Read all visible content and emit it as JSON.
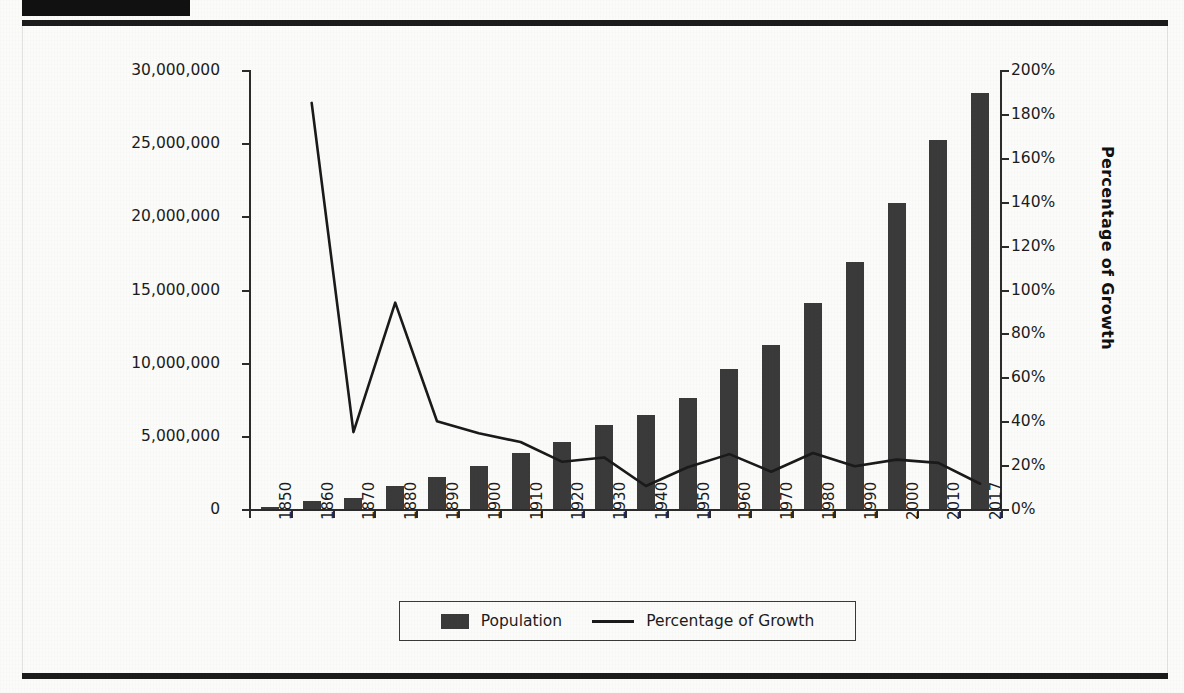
{
  "header": {
    "block_label": "",
    "title": "",
    "rule_color": "#1b1b1b"
  },
  "colors": {
    "bar": "#3a3a3a",
    "line": "#1a1a1a",
    "axis": "#2b2b2b",
    "text": "#1c1c1c",
    "background": "#fbfbfa"
  },
  "axis_left": {
    "title": "Population",
    "ticks": [
      "0",
      "5,000,000",
      "10,000,000",
      "15,000,000",
      "20,000,000",
      "25,000,000",
      "30,000,000"
    ]
  },
  "axis_right": {
    "title": "Percentage of Growth",
    "ticks": [
      "0%",
      "20%",
      "40%",
      "60%",
      "80%",
      "100%",
      "120%",
      "140%",
      "160%",
      "180%",
      "200%"
    ]
  },
  "legend": {
    "position": "bottom",
    "items": [
      {
        "label": "Population",
        "marker": "bar-swatch"
      },
      {
        "label": "Percentage of Growth",
        "marker": "line-swatch"
      }
    ]
  },
  "chart_data": {
    "type": "bar",
    "title": "",
    "xlabel": "",
    "ylabel": "Population",
    "y2label": "Percentage of Growth",
    "grid": false,
    "legend_position": "bottom",
    "ylim": [
      0,
      30000000
    ],
    "y2lim": [
      0,
      2.0
    ],
    "ytick_step": 5000000,
    "y2tick_step": 0.2,
    "categories": [
      "1850",
      "1860",
      "1870",
      "1880",
      "1890",
      "1900",
      "1910",
      "1920",
      "1930",
      "1940",
      "1950",
      "1960",
      "1970",
      "1980",
      "1990",
      "2000",
      "2010",
      "2017"
    ],
    "series": [
      {
        "name": "Population",
        "axis": "left",
        "render": "bar",
        "values": [
          170000,
          555000,
          780000,
          1600000,
          2190000,
          2910000,
          3800000,
          4600000,
          5720000,
          6400000,
          7620000,
          9600000,
          11200000,
          14100000,
          16900000,
          20900000,
          25250000,
          28400000
        ]
      },
      {
        "name": "Percentage of Growth",
        "axis": "right",
        "render": "line",
        "values": [
          null,
          1.85,
          0.35,
          0.94,
          0.4,
          0.345,
          0.305,
          0.215,
          0.235,
          0.105,
          0.19,
          0.25,
          0.17,
          0.255,
          0.195,
          0.225,
          0.21,
          0.115
        ]
      }
    ]
  }
}
